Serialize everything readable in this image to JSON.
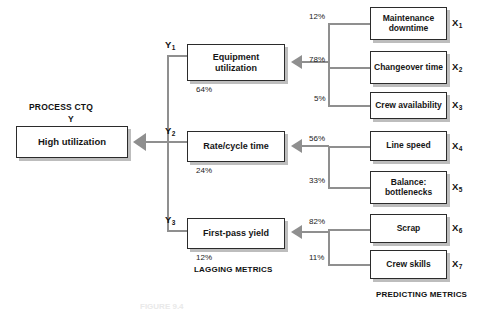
{
  "figure": {
    "type": "tree-diagram",
    "headers": {
      "ctq_line1": "PROCESS CTQ",
      "ctq_line2": "Y",
      "lagging": "LAGGING METRICS",
      "predicting": "PREDICTING METRICS"
    },
    "caption_partial": "FIGURE 9.4"
  },
  "ctq": {
    "label": "High utilization",
    "tag": "Y"
  },
  "lagging_metrics": [
    {
      "tag": "Y",
      "sub": "1",
      "label": "Equipment utilization",
      "value": "64%"
    },
    {
      "tag": "Y",
      "sub": "2",
      "label": "Rate/cycle time",
      "value": "24%"
    },
    {
      "tag": "Y",
      "sub": "3",
      "label": "First-pass yield",
      "value": "12%"
    }
  ],
  "predicting_metrics": [
    {
      "tag": "X",
      "sub": "1",
      "label": "Maintenance downtime",
      "pct": "12%",
      "parent": "Y1"
    },
    {
      "tag": "X",
      "sub": "2",
      "label": "Changeover time",
      "pct": "78%",
      "parent": "Y1"
    },
    {
      "tag": "X",
      "sub": "3",
      "label": "Crew availability",
      "pct": "5%",
      "parent": "Y1"
    },
    {
      "tag": "X",
      "sub": "4",
      "label": "Line speed",
      "pct": "56%",
      "parent": "Y2"
    },
    {
      "tag": "X",
      "sub": "5",
      "label": "Balance: bottlenecks",
      "pct": "33%",
      "parent": "Y2"
    },
    {
      "tag": "X",
      "sub": "6",
      "label": "Scrap",
      "pct": "82%",
      "parent": "Y3"
    },
    {
      "tag": "X",
      "sub": "7",
      "label": "Crew skills",
      "pct": "11%",
      "parent": "Y3"
    }
  ],
  "colors": {
    "connector": "#8f8f8f",
    "box_border": "#2b2b2b",
    "box_shadow": "#bdbdbd",
    "text": "#111111",
    "background": "#ffffff"
  }
}
